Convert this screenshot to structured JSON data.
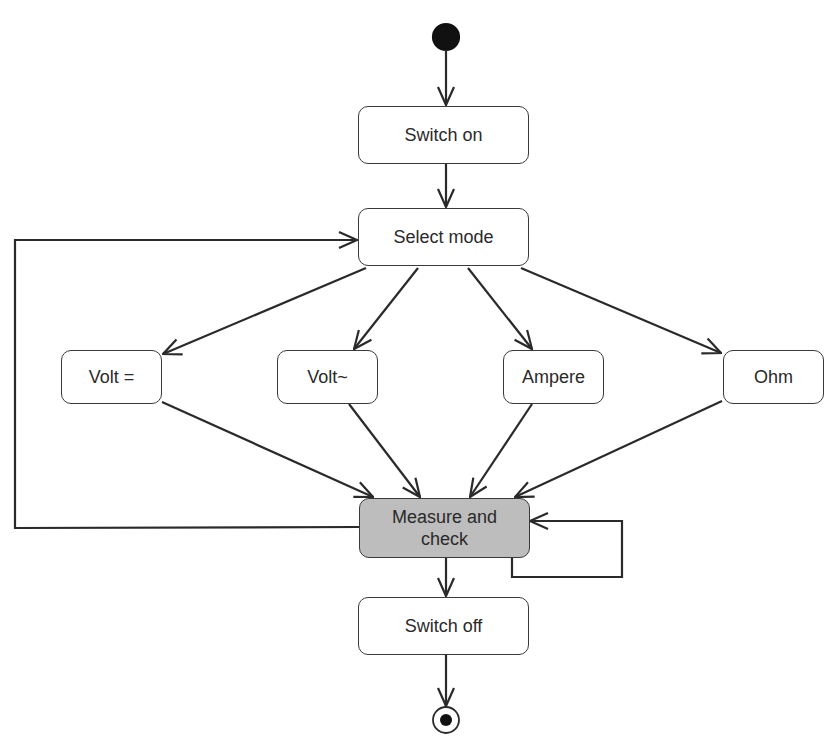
{
  "diagram": {
    "type": "UML activity diagram",
    "nodes": {
      "start": {
        "kind": "initial-node"
      },
      "switch_on": {
        "label": "Switch on"
      },
      "select_mode": {
        "label": "Select mode"
      },
      "volt_dc": {
        "label": "Volt ="
      },
      "volt_ac": {
        "label": "Volt~"
      },
      "ampere": {
        "label": "Ampere"
      },
      "ohm": {
        "label": "Ohm"
      },
      "measure": {
        "label": "Measure and check",
        "line1": "Measure and",
        "line2": "check"
      },
      "switch_off": {
        "label": "Switch off"
      },
      "end": {
        "kind": "final-node"
      }
    },
    "edges": [
      {
        "from": "start",
        "to": "switch_on"
      },
      {
        "from": "switch_on",
        "to": "select_mode"
      },
      {
        "from": "select_mode",
        "to": "volt_dc"
      },
      {
        "from": "select_mode",
        "to": "volt_ac"
      },
      {
        "from": "select_mode",
        "to": "ampere"
      },
      {
        "from": "select_mode",
        "to": "ohm"
      },
      {
        "from": "volt_dc",
        "to": "measure"
      },
      {
        "from": "volt_ac",
        "to": "measure"
      },
      {
        "from": "ampere",
        "to": "measure"
      },
      {
        "from": "ohm",
        "to": "measure"
      },
      {
        "from": "measure",
        "to": "select_mode"
      },
      {
        "from": "measure",
        "to": "measure"
      },
      {
        "from": "measure",
        "to": "switch_off"
      },
      {
        "from": "switch_off",
        "to": "end"
      }
    ],
    "colors": {
      "line": "#2a2a2a",
      "highlight_fill": "#bdbdbd",
      "node_fill": "#ffffff"
    }
  }
}
